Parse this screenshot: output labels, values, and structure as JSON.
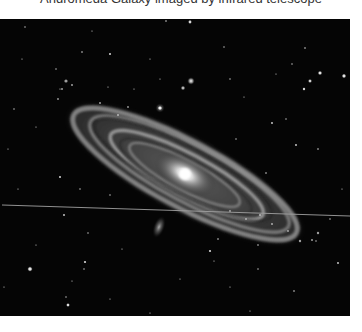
{
  "caption": {
    "text": "Andromeda Galaxy imaged by infrared telescope",
    "clipped": true
  },
  "image": {
    "subject": "spiral galaxy (Andromeda / M31) in infrared, grayscale",
    "alt": "Grayscale infrared image of the Andromeda spiral galaxy tilted diagonally across a black star field, with two small companion galaxies and a thin bright satellite trail crossing horizontally",
    "features": {
      "main_galaxy": "large tilted spiral with bright core and dusty ring arms",
      "companion_upper": "small bright elliptical companion above the disk",
      "companion_lower": "small diffuse elongated companion below the disk",
      "trail": "thin horizontal streak across the image"
    },
    "colors": {
      "sky": "#050505",
      "core": "#f4f4f4",
      "arms": "#b8b8b8",
      "trail": "#9a9a9a",
      "page": "#ffffff"
    }
  }
}
